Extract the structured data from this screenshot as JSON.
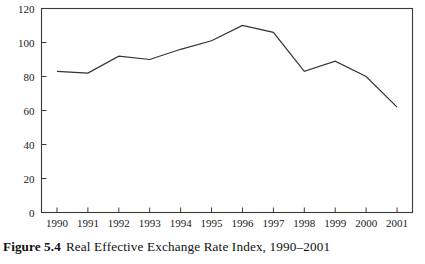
{
  "caption": {
    "label": "Figure 5.4",
    "text": "Real Effective Exchange Rate Index, 1990–2001"
  },
  "colors": {
    "line": "#333333",
    "frame": "#3a3a3a",
    "background": "#ffffff",
    "text": "#1a1a1a"
  },
  "chart_data": {
    "type": "line",
    "title": "Real Effective Exchange Rate Index, 1990–2001",
    "xlabel": "",
    "ylabel": "",
    "categories": [
      "1990",
      "1991",
      "1992",
      "1993",
      "1994",
      "1995",
      "1996",
      "1997",
      "1998",
      "1999",
      "2000",
      "2001"
    ],
    "values": [
      83,
      82,
      92,
      90,
      96,
      101,
      110,
      106,
      83,
      89,
      80,
      62
    ],
    "series": [
      {
        "name": "Real Effective Exchange Rate Index",
        "values": [
          83,
          82,
          92,
          90,
          96,
          101,
          110,
          106,
          83,
          89,
          80,
          62
        ]
      }
    ],
    "ylim": [
      0,
      120
    ],
    "yticks": [
      0,
      20,
      40,
      60,
      80,
      100,
      120
    ],
    "ytick_labels": [
      "0",
      "20",
      "40",
      "60",
      "80",
      "100",
      "120"
    ],
    "xtick_labels": [
      "1990",
      "1991",
      "1992",
      "1993",
      "1994",
      "1995",
      "1996",
      "1997",
      "1998",
      "1999",
      "2000",
      "2001"
    ],
    "grid": false,
    "legend": false,
    "legend_position": "none"
  }
}
